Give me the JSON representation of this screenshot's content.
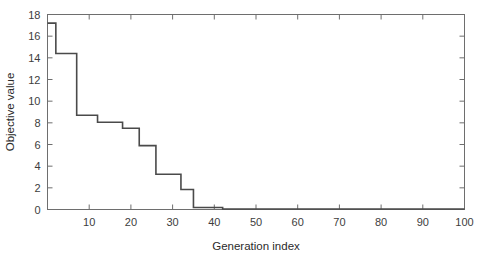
{
  "figure": {
    "background_color": "#ffffff",
    "axis_color": "#6e6e6e",
    "line_color": "#4a4a4a"
  },
  "caption": {
    "text": ""
  },
  "chart_data": {
    "type": "line",
    "drawstyle": "steps-post",
    "title": "",
    "xlabel": "Generation index",
    "ylabel": "Objective value",
    "xlim": [
      0,
      100
    ],
    "ylim": [
      0,
      18
    ],
    "grid": false,
    "legend": null,
    "xticks": [
      0,
      10,
      20,
      30,
      40,
      50,
      60,
      70,
      80,
      90,
      100
    ],
    "xticklabels": [
      "",
      "10",
      "20",
      "30",
      "40",
      "50",
      "60",
      "70",
      "80",
      "90",
      "100"
    ],
    "yticks": [
      0,
      2,
      4,
      6,
      8,
      10,
      12,
      14,
      16,
      18
    ],
    "yticklabels": [
      "0",
      "2",
      "4",
      "6",
      "8",
      "10",
      "12",
      "14",
      "16",
      "18"
    ],
    "series": [
      {
        "name": "best objective value",
        "x": [
          1,
          2,
          6,
          7,
          12,
          18,
          22,
          26,
          32,
          35,
          42,
          100
        ],
        "values": [
          17.2,
          14.4,
          14.4,
          8.7,
          8.05,
          7.5,
          5.9,
          3.25,
          1.85,
          0.18,
          0.05,
          0.05
        ]
      }
    ],
    "points": [
      [
        1,
        17.2
      ],
      [
        2,
        14.4
      ],
      [
        6,
        14.4
      ],
      [
        7,
        8.7
      ],
      [
        12,
        8.05
      ],
      [
        18,
        7.5
      ],
      [
        22,
        5.9
      ],
      [
        26,
        3.25
      ],
      [
        32,
        1.85
      ],
      [
        35,
        0.18
      ],
      [
        42,
        0.05
      ],
      [
        100,
        0.05
      ]
    ]
  }
}
